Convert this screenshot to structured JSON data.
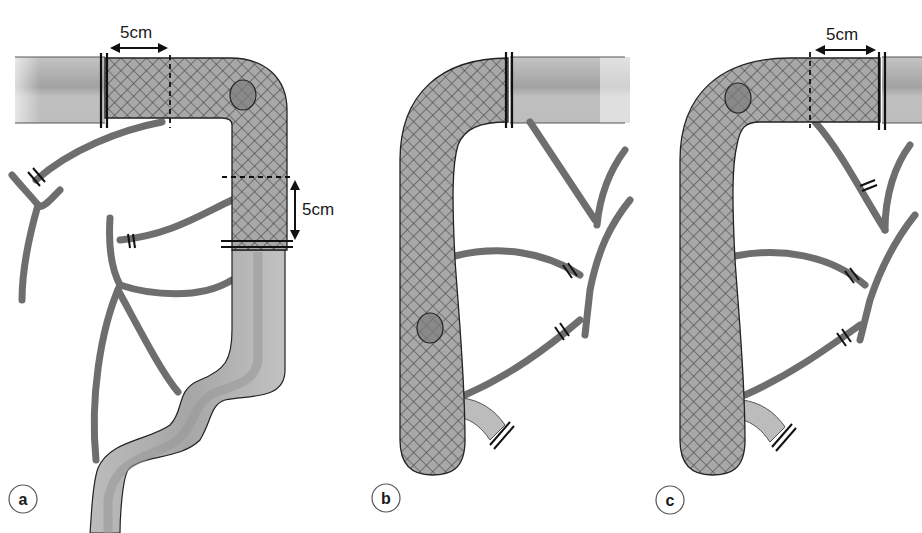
{
  "figure": {
    "colors": {
      "resected_fill": "#9a9a9a",
      "mesh_line": "#3a3a3a",
      "bowel_fill": "#b8b8b8",
      "bowel_stripe": "#a0a0a0",
      "vessel": "#6e6e6e",
      "outline": "#1a1a1a",
      "tumour": "#7a7a7a"
    }
  },
  "panels": [
    {
      "id": "a",
      "label": "a",
      "measurements": [
        "5cm",
        "5cm"
      ],
      "elements": [
        "resected segment (hatched)",
        "tumour",
        "proximal margin 5cm",
        "distal margin 5cm",
        "ligated vessels x2",
        "remaining bowel (sigmoid)"
      ]
    },
    {
      "id": "b",
      "label": "b",
      "measurements": [],
      "elements": [
        "resected segment (hatched)",
        "tumour",
        "bowel transection",
        "ligated vessels x3"
      ]
    },
    {
      "id": "c",
      "label": "c",
      "measurements": [
        "5cm"
      ],
      "elements": [
        "resected segment (hatched)",
        "tumour",
        "distal margin 5cm",
        "ligated vessels x4"
      ]
    }
  ]
}
